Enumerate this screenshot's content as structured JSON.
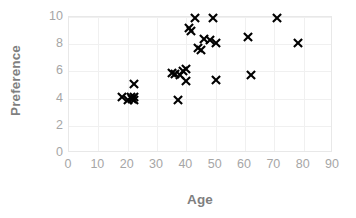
{
  "chart_data": {
    "type": "scatter",
    "title": "",
    "xlabel": "Age",
    "ylabel": "Preference",
    "xlim": [
      0,
      90
    ],
    "ylim": [
      0,
      10
    ],
    "xticks": [
      0,
      10,
      20,
      30,
      40,
      50,
      60,
      70,
      80,
      90
    ],
    "yticks": [
      0,
      2,
      4,
      6,
      8,
      10
    ],
    "grid": true,
    "legend": null,
    "marker": "x",
    "marker_color": "#000000",
    "series": [
      {
        "name": "Preference vs Age",
        "points": [
          [
            18,
            4.1
          ],
          [
            20,
            3.9
          ],
          [
            21,
            4.1
          ],
          [
            21.5,
            4.0
          ],
          [
            22,
            4.1
          ],
          [
            22,
            3.9
          ],
          [
            22,
            5.1
          ],
          [
            35,
            5.9
          ],
          [
            36,
            5.8
          ],
          [
            37,
            3.9
          ],
          [
            38,
            5.7
          ],
          [
            39,
            6.0
          ],
          [
            40,
            6.2
          ],
          [
            40,
            5.3
          ],
          [
            41,
            9.2
          ],
          [
            41.5,
            9.0
          ],
          [
            43,
            9.9
          ],
          [
            44,
            7.7
          ],
          [
            45,
            7.6
          ],
          [
            46,
            8.4
          ],
          [
            48,
            8.3
          ],
          [
            49,
            9.9
          ],
          [
            50,
            8.1
          ],
          [
            50,
            5.4
          ],
          [
            61,
            8.5
          ],
          [
            62,
            5.7
          ],
          [
            71,
            9.9
          ],
          [
            78,
            8.1
          ]
        ]
      }
    ]
  },
  "axes": {
    "y_title": "Preference",
    "x_title": "Age",
    "y_tick_labels": [
      "10",
      "8",
      "6",
      "4",
      "2",
      "0"
    ],
    "x_tick_labels": [
      "0",
      "10",
      "20",
      "30",
      "40",
      "50",
      "60",
      "70",
      "80",
      "90"
    ]
  }
}
